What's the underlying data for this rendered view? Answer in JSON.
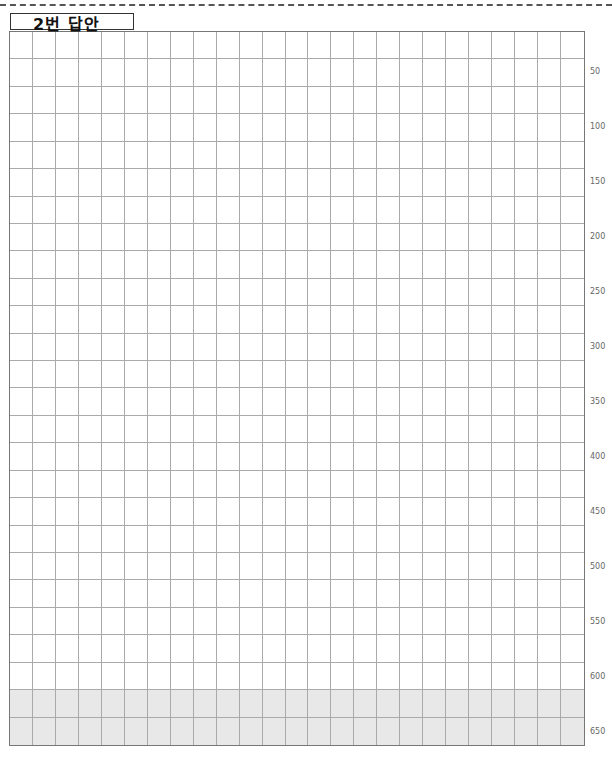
{
  "header": {
    "title": "2번 답안"
  },
  "grid": {
    "columns": 25,
    "rows": 26,
    "shaded_rows": [
      24,
      25
    ],
    "shade_color": "#e8e8e8"
  },
  "row_labels": [
    "50",
    "100",
    "150",
    "200",
    "250",
    "300",
    "350",
    "400",
    "450",
    "500",
    "550",
    "600",
    "650"
  ]
}
